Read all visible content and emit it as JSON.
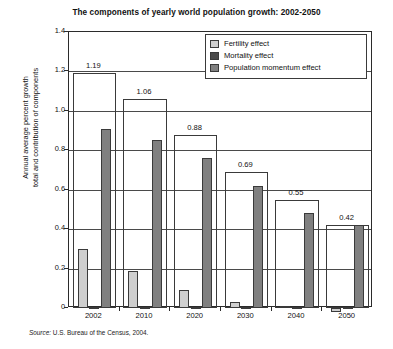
{
  "chart_data": {
    "type": "bar",
    "title": "The components of yearly world population growth: 2002-2050",
    "xlabel": "",
    "ylabel": "Annual average percent growth total and contribution of components",
    "ylabel_line1": "Annual average percent growth",
    "ylabel_line2": "total and contribution of components",
    "categories": [
      "2002",
      "2010",
      "2020",
      "2030",
      "2040",
      "2050"
    ],
    "ylim": [
      0,
      1.4
    ],
    "yticks": [
      "0",
      "0.2",
      "0.4",
      "0.6",
      "0.8",
      "1.0",
      "1.2",
      "1.4"
    ],
    "ytick_values": [
      0,
      0.2,
      0.4,
      0.6,
      0.8,
      1.0,
      1.2,
      1.4
    ],
    "grid": true,
    "legend_position": "top-right",
    "total_labels": [
      "1.19",
      "1.06",
      "0.88",
      "0.69",
      "0.55",
      "0.42"
    ],
    "totals": [
      1.19,
      1.06,
      0.88,
      0.69,
      0.55,
      0.42
    ],
    "series": [
      {
        "name": "Fertility effect",
        "color": "#cfcfcf",
        "values": [
          0.3,
          0.19,
          0.09,
          0.03,
          0.01,
          -0.02
        ]
      },
      {
        "name": "Mortality effect",
        "color": "#4a4a4a",
        "values": [
          0.005,
          0.005,
          0.004,
          0.004,
          0.003,
          0.003
        ]
      },
      {
        "name": "Population momentum effect",
        "color": "#808080",
        "values": [
          0.91,
          0.85,
          0.76,
          0.62,
          0.48,
          0.42
        ]
      }
    ],
    "annotations": {
      "source": "Source: U.S. Bureau of the Census, 2004.",
      "source_word": "Source:",
      "source_rest": " U.S. Bureau of the Census, 2004."
    }
  },
  "legend": {
    "items": [
      {
        "label": "Fertility effect",
        "swatch": "fertility-swatch"
      },
      {
        "label": "Mortality effect",
        "swatch": "mortality-swatch"
      },
      {
        "label": "Population momentum effect",
        "swatch": "momentum-swatch"
      }
    ]
  }
}
